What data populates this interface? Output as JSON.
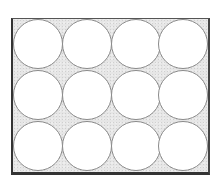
{
  "diagram": {
    "title": "",
    "grid": {
      "columns": 4,
      "rows": 3
    },
    "colors": {
      "background_fill": "#e6e6e6",
      "circle_fill": "#ffffff",
      "circle_stroke": "#8a8a8a",
      "frame_stroke": "#333333"
    },
    "circles": [
      {
        "row": 0,
        "col": 0,
        "cx": 38,
        "cy": 44,
        "r": 25
      },
      {
        "row": 0,
        "col": 1,
        "cx": 87,
        "cy": 44,
        "r": 25
      },
      {
        "row": 0,
        "col": 2,
        "cx": 136,
        "cy": 44,
        "r": 25
      },
      {
        "row": 0,
        "col": 3,
        "cx": 183,
        "cy": 44,
        "r": 25
      },
      {
        "row": 1,
        "col": 0,
        "cx": 38,
        "cy": 95,
        "r": 25
      },
      {
        "row": 1,
        "col": 1,
        "cx": 87,
        "cy": 95,
        "r": 25
      },
      {
        "row": 1,
        "col": 2,
        "cx": 136,
        "cy": 95,
        "r": 25
      },
      {
        "row": 1,
        "col": 3,
        "cx": 183,
        "cy": 95,
        "r": 25
      },
      {
        "row": 2,
        "col": 0,
        "cx": 38,
        "cy": 146,
        "r": 25
      },
      {
        "row": 2,
        "col": 1,
        "cx": 87,
        "cy": 146,
        "r": 25
      },
      {
        "row": 2,
        "col": 2,
        "cx": 136,
        "cy": 146,
        "r": 25
      },
      {
        "row": 2,
        "col": 3,
        "cx": 183,
        "cy": 146,
        "r": 25
      }
    ]
  }
}
